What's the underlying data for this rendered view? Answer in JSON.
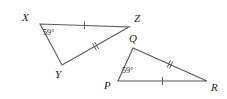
{
  "figure": {
    "background_color": "#ffffff",
    "stroke_color": "#58595b",
    "text_color": "#231f20",
    "stroke_width": 1.1,
    "tick_stroke_width": 1.0,
    "width": 227,
    "height": 99
  },
  "triangles": [
    {
      "name": "triangle-xyz",
      "vertices": [
        {
          "label": "X",
          "x": 40,
          "y": 24,
          "label_x": 22,
          "label_y": 12
        },
        {
          "label": "Y",
          "x": 62,
          "y": 65,
          "label_x": 55,
          "label_y": 69
        },
        {
          "label": "Z",
          "x": 129,
          "y": 27,
          "label_x": 134,
          "label_y": 13
        }
      ],
      "angle": {
        "vertex": "X",
        "text": "59°",
        "label_x": 43,
        "label_y": 29
      },
      "ticks": [
        {
          "name": "tick-xz",
          "count": 1,
          "from": "X",
          "to": "Z"
        },
        {
          "name": "tick-yz",
          "count": 2,
          "from": "Y",
          "to": "Z"
        }
      ]
    },
    {
      "name": "triangle-pqr",
      "vertices": [
        {
          "label": "P",
          "x": 118,
          "y": 81,
          "label_x": 104,
          "label_y": 80
        },
        {
          "label": "Q",
          "x": 133,
          "y": 48,
          "label_x": 129,
          "label_y": 33
        },
        {
          "label": "R",
          "x": 207,
          "y": 81,
          "label_x": 211,
          "label_y": 82
        }
      ],
      "angle": {
        "vertex": "P",
        "text": "59°",
        "label_x": 122,
        "label_y": 67
      },
      "ticks": [
        {
          "name": "tick-pr",
          "count": 1,
          "from": "P",
          "to": "R"
        },
        {
          "name": "tick-qr",
          "count": 2,
          "from": "Q",
          "to": "R"
        }
      ]
    }
  ]
}
